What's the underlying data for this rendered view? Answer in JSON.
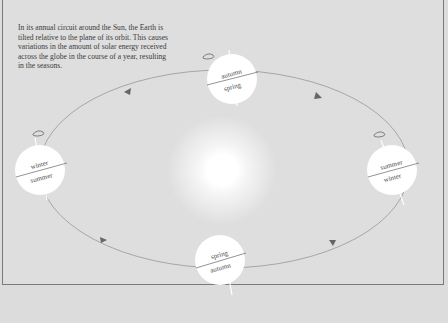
{
  "caption": "In its annual circuit around the Sun, the Earth is tilted relative to the plane of its orbit. This causes variations in the amount of solar energy received across the globe in the course of a year, resulting in the seasons.",
  "sun": {
    "icon": "sun-glow"
  },
  "orbit": {
    "direction_arrows": 6,
    "color": "#8a8a8a"
  },
  "earths": [
    {
      "position": "top",
      "upper": "autumn",
      "lower": "spring"
    },
    {
      "position": "left",
      "upper": "winter",
      "lower": "summer"
    },
    {
      "position": "right",
      "upper": "summer",
      "lower": "winter"
    },
    {
      "position": "bottom",
      "upper": "spring",
      "lower": "autumn"
    }
  ],
  "colors": {
    "background": "#dedede",
    "border": "#7a7a7a",
    "earth": "#ffffff",
    "text": "#3a3a3a"
  }
}
